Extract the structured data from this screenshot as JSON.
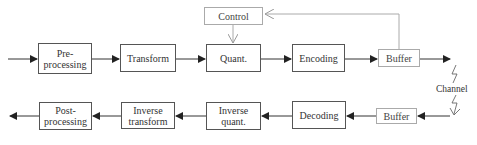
{
  "diagram": {
    "encoder": {
      "preprocessing": "Pre-\nprocessing",
      "transform": "Transform",
      "quant": "Quant.",
      "encoding": "Encoding",
      "buffer": "Buffer",
      "control": "Control"
    },
    "channel": "Channel",
    "decoder": {
      "buffer": "Buffer",
      "decoding": "Decoding",
      "inverse_quant": "Inverse\nquant.",
      "inverse_transform": "Inverse\ntransform",
      "postprocessing": "Post-\nprocessing"
    },
    "colors": {
      "line": "#333333",
      "light_line": "#aaaaaa"
    }
  }
}
